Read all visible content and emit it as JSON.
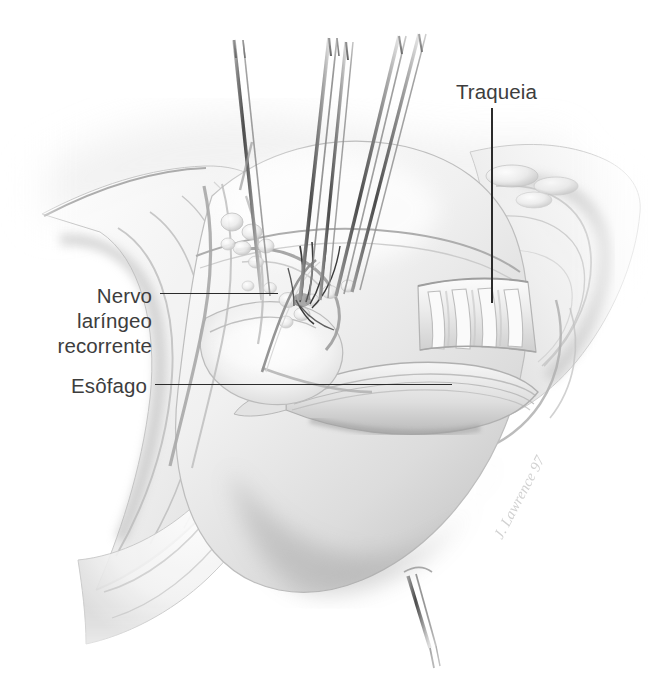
{
  "figure": {
    "type": "medical-illustration",
    "technique": "grayscale pencil / graphite rendering",
    "background_color": "#ffffff",
    "label_color": "#3d3d3d",
    "leader_color": "#2b2b2b",
    "signature": "J. Lawrence 97"
  },
  "labels": [
    {
      "id": "traqueia",
      "text": "Traqueia",
      "lines": [
        "Traqueia"
      ],
      "align": "left",
      "leader": {
        "orientation": "vertical",
        "x": 491,
        "y1": 108,
        "y2": 303
      }
    },
    {
      "id": "nervo-laringeo-recorrente",
      "text": "Nervo\nlaríngeo\nrecorrente",
      "lines": [
        "Nervo",
        "laríngeo",
        "recorrente"
      ],
      "align": "right",
      "leader": {
        "orientation": "horizontal",
        "y": 293,
        "x1": 160,
        "x2": 278
      }
    },
    {
      "id": "esofago",
      "text": "Esôfago",
      "lines": [
        "Esôfago"
      ],
      "align": "right",
      "leader": {
        "orientation": "horizontal",
        "y": 384,
        "x1": 155,
        "x2": 452
      }
    }
  ],
  "structures": [
    "traqueia",
    "aneis cartilaginosos traqueais",
    "esofago",
    "nervo laringeo recorrente",
    "fascia cervical",
    "linfonodos",
    "retratores cirurgicos",
    "fios de sutura"
  ],
  "instruments": {
    "top_retractors": 3,
    "bottom_retractor": 1
  }
}
